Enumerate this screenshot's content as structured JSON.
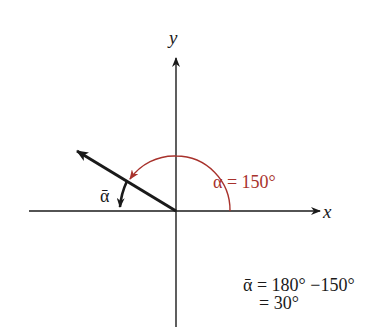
{
  "diagram": {
    "type": "reference-angle",
    "axes": {
      "x_label": "x",
      "y_label": "y"
    },
    "angle": {
      "symbol": "α",
      "value_deg": 150,
      "label": "α = 150°",
      "color": "#a8322c"
    },
    "reference_angle": {
      "symbol": "ᾱ",
      "label": "ᾱ"
    },
    "equation": {
      "line1_lhs": "ᾱ",
      "line1_rhs": "= 180° −150°",
      "line2": "= 30°"
    },
    "colors": {
      "axis": "#1a1a1a",
      "terminal_side": "#1a1a1a",
      "angle_arc": "#a8322c",
      "background": "#ffffff"
    }
  }
}
